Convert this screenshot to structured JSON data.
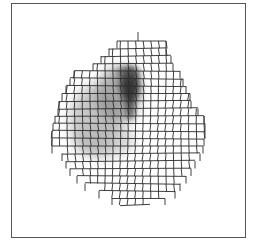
{
  "figure": {
    "frame": {
      "x": 11,
      "y": 3,
      "width": 234,
      "height": 234,
      "color": "#555555"
    },
    "mesh": {
      "line_color": "#2a2a2a",
      "cell": 7.6,
      "spike": {
        "x": 138,
        "y1": 32,
        "y2": 41
      },
      "rows": [
        {
          "y": 41,
          "x0": 117,
          "x1": 166
        },
        {
          "y": 48.5,
          "x0": 109,
          "x1": 166
        },
        {
          "y": 56,
          "x0": 101,
          "x1": 171
        },
        {
          "y": 63.5,
          "x0": 93,
          "x1": 173
        },
        {
          "y": 71,
          "x0": 74,
          "x1": 180
        },
        {
          "y": 78.5,
          "x0": 70,
          "x1": 183
        },
        {
          "y": 86,
          "x0": 66,
          "x1": 186
        },
        {
          "y": 93.5,
          "x0": 62,
          "x1": 190
        },
        {
          "y": 101,
          "x0": 59,
          "x1": 191
        },
        {
          "y": 108.5,
          "x0": 58,
          "x1": 198
        },
        {
          "y": 116,
          "x0": 55,
          "x1": 204
        },
        {
          "y": 123.5,
          "x0": 53,
          "x1": 205
        },
        {
          "y": 131,
          "x0": 52,
          "x1": 205
        },
        {
          "y": 138.5,
          "x0": 52,
          "x1": 204
        },
        {
          "y": 146,
          "x0": 52,
          "x1": 203
        },
        {
          "y": 153.5,
          "x0": 62,
          "x1": 200
        },
        {
          "y": 161,
          "x0": 66,
          "x1": 195
        },
        {
          "y": 168.5,
          "x0": 70,
          "x1": 191
        },
        {
          "y": 176,
          "x0": 77,
          "x1": 186
        },
        {
          "y": 183.5,
          "x0": 85,
          "x1": 180
        },
        {
          "y": 191,
          "x0": 99,
          "x1": 175
        },
        {
          "y": 198.5,
          "x0": 112,
          "x1": 165
        },
        {
          "y": 205,
          "x0": 120,
          "x1": 150
        }
      ]
    },
    "intensity": {
      "blobs": [
        {
          "cx": 95,
          "cy": 120,
          "rx": 25,
          "ry": 35,
          "color": "#9a9a9a",
          "opacity": 0.55
        },
        {
          "cx": 118,
          "cy": 95,
          "rx": 22,
          "ry": 28,
          "color": "#7a7a7a",
          "opacity": 0.6
        },
        {
          "cx": 105,
          "cy": 140,
          "rx": 30,
          "ry": 18,
          "color": "#b0b0b0",
          "opacity": 0.5
        },
        {
          "cx": 130,
          "cy": 85,
          "rx": 10,
          "ry": 18,
          "color": "#222222",
          "opacity": 0.85
        },
        {
          "cx": 130,
          "cy": 108,
          "rx": 4,
          "ry": 12,
          "color": "#333333",
          "opacity": 0.8
        },
        {
          "cx": 128,
          "cy": 72,
          "rx": 12,
          "ry": 6,
          "color": "#555555",
          "opacity": 0.6
        }
      ]
    }
  }
}
